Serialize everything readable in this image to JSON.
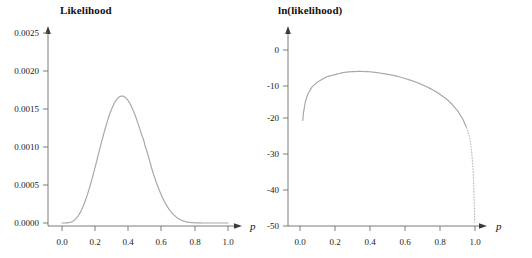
{
  "figure": {
    "background": "#ffffff",
    "curve_color": "#a8a8a8",
    "axis_color": "#6d6d6d",
    "text_color": "#111111"
  },
  "panels": {
    "left": {
      "title": "Likelihood",
      "xlabel": "p",
      "xticks": [
        "0.0",
        "0.2",
        "0.4",
        "0.6",
        "0.8",
        "1.0"
      ],
      "yticks": [
        "0.0000",
        "0.0005",
        "0.0010",
        "0.0015",
        "0.0020",
        "0.0025"
      ]
    },
    "right": {
      "title": "ln(likelihood)",
      "xlabel": "p",
      "xticks": [
        "0.0",
        "0.2",
        "0.4",
        "0.6",
        "0.8",
        "1.0"
      ],
      "yticks": [
        "-50",
        "-40",
        "-30",
        "-20",
        "-10",
        "0"
      ]
    }
  },
  "chart_data": [
    {
      "type": "line",
      "title": "Likelihood",
      "xlabel": "p",
      "ylabel": "Likelihood",
      "xlim": [
        0.0,
        1.0
      ],
      "ylim": [
        0.0,
        0.0025
      ],
      "grid": false,
      "legend": "none",
      "xticks": [
        0.0,
        0.2,
        0.4,
        0.6,
        0.8,
        1.0
      ],
      "yticks": [
        0.0,
        0.0005,
        0.001,
        0.0015,
        0.002,
        0.0025
      ],
      "annotations": [
        "peak at p = 0.30, likelihood = 0.00222"
      ],
      "x": [
        0.0,
        0.02,
        0.04,
        0.06,
        0.08,
        0.1,
        0.12,
        0.14,
        0.16,
        0.18,
        0.2,
        0.22,
        0.24,
        0.26,
        0.28,
        0.3,
        0.32,
        0.34,
        0.36,
        0.38,
        0.4,
        0.42,
        0.44,
        0.46,
        0.48,
        0.5,
        0.55,
        0.6,
        0.65,
        0.7,
        0.75,
        0.8,
        0.85,
        0.9,
        0.95,
        1.0
      ],
      "y": [
        0.0,
        3e-07,
        4e-06,
        1.8e-05,
        4.9e-05,
        0.000103,
        0.000183,
        0.00029,
        0.000422,
        0.000574,
        0.000739,
        0.00091,
        0.00108,
        0.00124,
        0.001385,
        0.001505,
        0.001595,
        0.00165,
        0.00167,
        0.001655,
        0.001605,
        0.001525,
        0.00142,
        0.001295,
        0.00116,
        0.001015,
        0.00065,
        0.00036,
        0.000166,
        6e-05,
        1.55e-05,
        2.5e-06,
        2e-07,
        0.0,
        0.0,
        0.0
      ],
      "curve_shape_note": "unimodal beta-like likelihood, peak 0.00222 at p=0.30, near zero by p=0.85"
    },
    {
      "type": "line",
      "title": "ln(likelihood)",
      "xlabel": "p",
      "ylabel": "ln(likelihood)",
      "xlim": [
        0.0,
        1.0
      ],
      "ylim": [
        -50,
        0
      ],
      "grid": false,
      "legend": "none",
      "xticks": [
        0.0,
        0.2,
        0.4,
        0.6,
        0.8,
        1.0
      ],
      "yticks": [
        -50,
        -40,
        -30,
        -20,
        -10,
        0
      ],
      "annotations": [
        "maximum ln(likelihood) = -6.1 near p = 0.32",
        "steep drop toward -50 as p approaches 1.0",
        "left branch drops below -20 near p = 0.015"
      ],
      "x": [
        0.015,
        0.02,
        0.03,
        0.04,
        0.05,
        0.07,
        0.1,
        0.15,
        0.2,
        0.25,
        0.3,
        0.35,
        0.4,
        0.45,
        0.5,
        0.55,
        0.6,
        0.65,
        0.7,
        0.75,
        0.8,
        0.85,
        0.9,
        0.93,
        0.95,
        0.965,
        0.975,
        0.982,
        0.988,
        0.992,
        0.995,
        0.997,
        0.999
      ],
      "y": [
        -20.0,
        -17.8,
        -14.9,
        -13.2,
        -12.0,
        -10.4,
        -9.1,
        -7.7,
        -7.0,
        -6.4,
        -6.15,
        -6.1,
        -6.2,
        -6.5,
        -6.9,
        -7.4,
        -8.1,
        -8.9,
        -9.9,
        -11.1,
        -12.6,
        -14.5,
        -17.2,
        -19.6,
        -21.8,
        -24.0,
        -26.5,
        -29.5,
        -33.5,
        -37.5,
        -41.5,
        -45.0,
        -49.0
      ]
    }
  ]
}
